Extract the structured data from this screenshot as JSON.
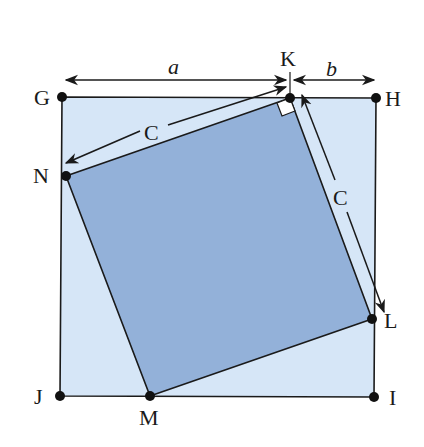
{
  "colors": {
    "outer_fill": "#d6e6f7",
    "inner_fill": "#93b1d9",
    "stroke": "#1a1a1a",
    "background": "#ffffff"
  },
  "points": {
    "G": {
      "label": "G",
      "x": 62,
      "y": 97
    },
    "K": {
      "label": "K",
      "x": 290,
      "y": 98
    },
    "H": {
      "label": "H",
      "x": 376,
      "y": 98
    },
    "N": {
      "label": "N",
      "x": 66,
      "y": 176
    },
    "L": {
      "label": "L",
      "x": 372,
      "y": 319
    },
    "J": {
      "label": "J",
      "x": 60,
      "y": 396
    },
    "M": {
      "label": "M",
      "x": 150,
      "y": 396
    },
    "I": {
      "label": "I",
      "x": 374,
      "y": 397
    }
  },
  "dimensions": {
    "a": "a",
    "b": "b",
    "c_top": "C",
    "c_right": "C"
  }
}
